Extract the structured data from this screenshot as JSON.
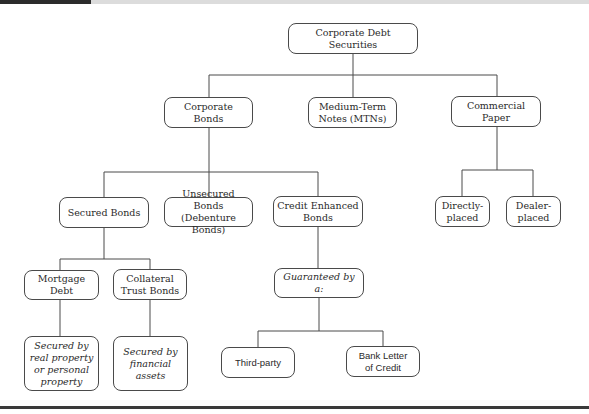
{
  "diagram": {
    "root": {
      "label": "Corporate Debt Securities"
    },
    "level1": [
      {
        "label": "Corporate\nBonds"
      },
      {
        "label": "Medium-Term\nNotes (MTNs)"
      },
      {
        "label": "Commercial\nPaper"
      }
    ],
    "bond_types": [
      {
        "label": "Secured Bonds"
      },
      {
        "label": "Unsecured Bonds\n(Debenture Bonds)"
      },
      {
        "label": "Credit Enhanced\nBonds"
      }
    ],
    "commercial_paper_types": [
      {
        "label": "Directly-\nplaced"
      },
      {
        "label": "Dealer-\nplaced"
      }
    ],
    "secured_types": [
      {
        "label": "Mortgage Debt",
        "note": "Secured by\nreal property\nor personal\nproperty"
      },
      {
        "label": "Collateral\nTrust Bonds",
        "note": "Secured by\nfinancial assets"
      }
    ],
    "credit_enhanced": {
      "guarantee_label": "Guaranteed by a:",
      "guarantors": [
        {
          "label": "Third-party"
        },
        {
          "label": "Bank Letter\nof Credit"
        }
      ]
    }
  }
}
